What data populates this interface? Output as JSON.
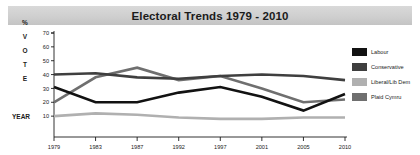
{
  "header": {
    "title": "Electoral Trends 1979 - 2010"
  },
  "axis_labels": {
    "y_stack": [
      "%",
      "V",
      "O",
      "T",
      "E"
    ],
    "x_corner": "YEAR"
  },
  "legend": {
    "position": "right",
    "items": [
      {
        "label": "Labour",
        "color": "#121212"
      },
      {
        "label": "Conservative",
        "color": "#3f3f3f"
      },
      {
        "label": "Liberal/Lib Dem",
        "color": "#b0b0b0"
      },
      {
        "label": "Plaid Cymru",
        "color": "#6f6f6f"
      }
    ]
  },
  "chart_data": {
    "type": "line",
    "title": "Electoral Trends 1979 - 2010",
    "xlabel": "YEAR",
    "ylabel": "% VOTE",
    "x": [
      "1979",
      "1983",
      "1987",
      "1992",
      "1997",
      "2001",
      "2005",
      "2010"
    ],
    "categories": [
      "1979",
      "1983",
      "1987",
      "1992",
      "1997",
      "2001",
      "2005",
      "2010"
    ],
    "ylim": [
      0,
      70
    ],
    "yticks": [
      10,
      20,
      30,
      40,
      50,
      60,
      70
    ],
    "grid": false,
    "legend_position": "right",
    "series": [
      {
        "name": "Labour",
        "color": "#121212",
        "values": [
          31,
          20,
          20,
          27,
          31,
          24,
          14,
          26
        ]
      },
      {
        "name": "Conservative",
        "color": "#3f3f3f",
        "values": [
          40,
          41,
          38,
          37,
          39,
          40,
          39,
          36
        ]
      },
      {
        "name": "Liberal/Lib Dem",
        "color": "#b0b0b0",
        "values": [
          10,
          12,
          11,
          9,
          8,
          8,
          9,
          9
        ]
      },
      {
        "name": "Plaid Cymru",
        "color": "#6f6f6f",
        "values": [
          20,
          38,
          45,
          36,
          39,
          30,
          20,
          22
        ]
      }
    ]
  }
}
